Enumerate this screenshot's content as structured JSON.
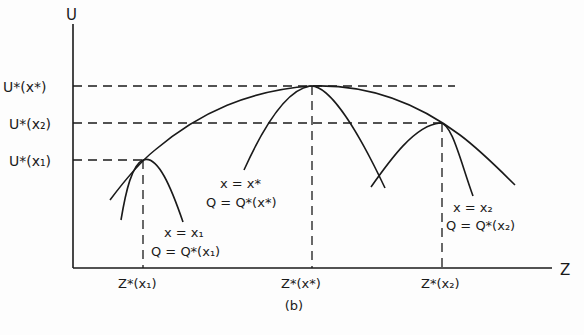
{
  "figure": {
    "caption": "(b)",
    "y_axis_label": "U",
    "x_axis_label": "Z",
    "y_ticks": [
      {
        "label": "U*(x*)",
        "base": "U",
        "arg": "x*"
      },
      {
        "label": "U*(x₂)",
        "base": "U",
        "arg": "x₂"
      },
      {
        "label": "U*(x₁)",
        "base": "U",
        "arg": "x₁"
      }
    ],
    "x_ticks": [
      {
        "label": "Z*(x₁)"
      },
      {
        "label": "Z*(x*)"
      },
      {
        "label": "Z*(x₂)"
      }
    ],
    "curve_labels": [
      {
        "line1": "x = x₁",
        "line2": "Q = Q*(x₁)"
      },
      {
        "line1": "x = x*",
        "line2": "Q = Q*(x*)"
      },
      {
        "line1": "x = x₂",
        "line2": "Q = Q*(x₂)"
      }
    ],
    "stroke_color": "#1a1a1a",
    "background": "#fdfdfd"
  }
}
